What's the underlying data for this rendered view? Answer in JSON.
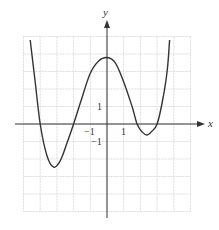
{
  "chart_data": {
    "type": "line",
    "title": "",
    "xlabel": "x",
    "ylabel": "y",
    "xlim": [
      -5,
      5
    ],
    "ylim": [
      -5,
      5
    ],
    "grid": true,
    "tick_labels": {
      "x": [
        {
          "value": -1,
          "label": "−1"
        },
        {
          "value": 1,
          "label": "1"
        }
      ],
      "y": [
        {
          "value": 1,
          "label": "1"
        },
        {
          "value": -1,
          "label": "−1"
        }
      ]
    },
    "series": [
      {
        "name": "f(x)",
        "color": "#333333",
        "points": [
          [
            -4.6,
            4.8
          ],
          [
            -4.3,
            2.4
          ],
          [
            -4.0,
            0
          ],
          [
            -3.6,
            -1.8
          ],
          [
            -3.2,
            -2.46
          ],
          [
            -2.8,
            -2.1
          ],
          [
            -2.4,
            -1.1
          ],
          [
            -2.0,
            0
          ],
          [
            -1.5,
            1.5
          ],
          [
            -1.0,
            2.9
          ],
          [
            -0.5,
            3.6
          ],
          [
            0,
            3.8
          ],
          [
            0.5,
            3.5
          ],
          [
            1.0,
            2.4
          ],
          [
            1.5,
            1.0
          ],
          [
            1.8,
            0
          ],
          [
            2.1,
            -0.45
          ],
          [
            2.4,
            -0.63
          ],
          [
            2.7,
            -0.4
          ],
          [
            3.0,
            0
          ],
          [
            3.3,
            1.2
          ],
          [
            3.6,
            3.0
          ],
          [
            3.75,
            4.8
          ]
        ]
      }
    ],
    "annotations": [
      "x-intercepts near -4, -2, 1.8, 3",
      "local max near (0, 3.8)",
      "local mins near (-3.2, -2.5) and (2.4, -0.6)"
    ]
  },
  "labels": {
    "x_axis": "x",
    "y_axis": "y",
    "x_tick_neg1": "−1",
    "x_tick_1": "1",
    "y_tick_1": "1",
    "y_tick_neg1": "−1"
  },
  "colors": {
    "grid": "#d4d4d4",
    "axis": "#333333",
    "curve": "#333333"
  }
}
